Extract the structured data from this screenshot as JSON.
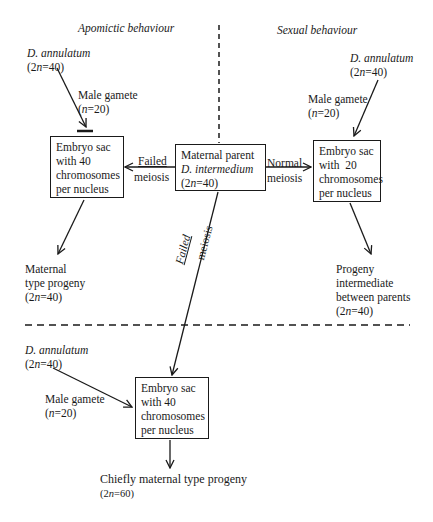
{
  "diagram": {
    "headings": {
      "left": "Apomictic behaviour",
      "right": "Sexual behaviour"
    },
    "maternal_parent": {
      "line1": "Maternal parent",
      "line2": "D. intermedium",
      "line3_pre": "(2",
      "line3_n": "n",
      "line3_post": "=40)"
    },
    "apomictic": {
      "donor": {
        "name": "D. annulatum",
        "pre": "(2",
        "n": "n",
        "post": "=40)"
      },
      "gamete": {
        "label": "Male gamete",
        "pre": "(",
        "n": "n",
        "post": "=20)"
      },
      "edge_label_1": "Failed",
      "edge_label_2": "meiosis",
      "embryo_sac": [
        "Embryo sac",
        "with 40",
        "chromosomes",
        "per nucleus"
      ],
      "progeny": {
        "line1": "Maternal",
        "line2": "type progeny",
        "pre": "(2",
        "n": "n",
        "post": "=40)"
      }
    },
    "sexual": {
      "donor": {
        "name": "D. annulatum",
        "pre": "(2",
        "n": "n",
        "post": "=40)"
      },
      "gamete": {
        "label": "Male gamete",
        "pre": "(",
        "n": "n",
        "post": "=20)"
      },
      "edge_label_1": "Normal",
      "edge_label_2": "meiosis",
      "embryo_sac": [
        "Embryo sac",
        "with  20",
        "chromosomes",
        "per nucleus"
      ],
      "progeny": {
        "line1": "Progeny",
        "line2": "intermediate",
        "line3": "between parents",
        "pre": "(2",
        "n": "n",
        "post": "=40)"
      }
    },
    "lower": {
      "donor": {
        "name": "D. annulatum",
        "pre": "(2",
        "n": "n",
        "post": "=40)"
      },
      "gamete": {
        "label": "Male gamete",
        "pre": "(",
        "n": "n",
        "post": "=20)"
      },
      "edge_label_1": "Failed",
      "edge_label_2": "meiosis",
      "embryo_sac": [
        "Embryo sac",
        "with 40",
        "chromosomes",
        "per nucleus"
      ],
      "progeny": {
        "line1": "Chiefly maternal type progeny",
        "pre": "(2",
        "n": "n",
        "post": "=60)"
      }
    }
  }
}
